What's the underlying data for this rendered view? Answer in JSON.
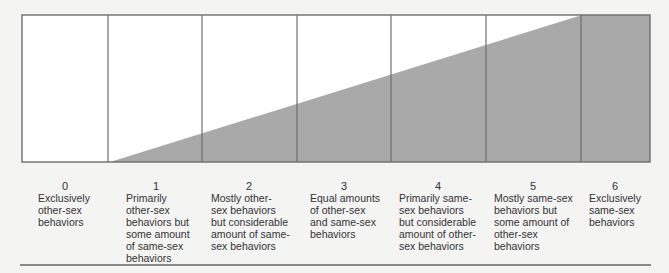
{
  "title": "",
  "colors": {
    "fill": "#a9a9a9",
    "box_bg": "#ffffff",
    "border": "#6e6e6e",
    "text": "#333333",
    "rule": "#8a8a8a"
  },
  "scale": [
    {
      "value": "0",
      "label": "Exclusively other-sex behaviors",
      "lines": [
        "Exclusively",
        "other-sex",
        "behaviors"
      ]
    },
    {
      "value": "1",
      "label": "Primarily other-sex behaviors but some amount of same-sex behaviors",
      "lines": [
        "Primarily",
        "other-sex",
        "behaviors but",
        "some amount",
        "of same-sex",
        "behaviors"
      ]
    },
    {
      "value": "2",
      "label": "Mostly other-sex behaviors but considerable amount of same-sex behaviors",
      "lines": [
        "Mostly other-",
        "sex behaviors",
        "but considerable",
        "amount of same-",
        "sex behaviors"
      ]
    },
    {
      "value": "3",
      "label": "Equal amounts of other-sex and same-sex behaviors",
      "lines": [
        "Equal amounts",
        "of other-sex",
        "and same-sex",
        "behaviors"
      ]
    },
    {
      "value": "4",
      "label": "Primarily same-sex behaviors but considerable amount of other-sex behaviors",
      "lines": [
        "Primarily same-",
        "sex behaviors",
        "but considerable",
        "amount of other-",
        "sex behaviors"
      ]
    },
    {
      "value": "5",
      "label": "Mostly same-sex behaviors but some amount of other-sex behaviors",
      "lines": [
        "Mostly same-sex",
        "behaviors but",
        "some amount of",
        "other-sex",
        "behaviors"
      ]
    },
    {
      "value": "6",
      "label": "Exclusively same-sex behaviors",
      "lines": [
        "Exclusively",
        "same-sex",
        "behaviors"
      ]
    }
  ]
}
